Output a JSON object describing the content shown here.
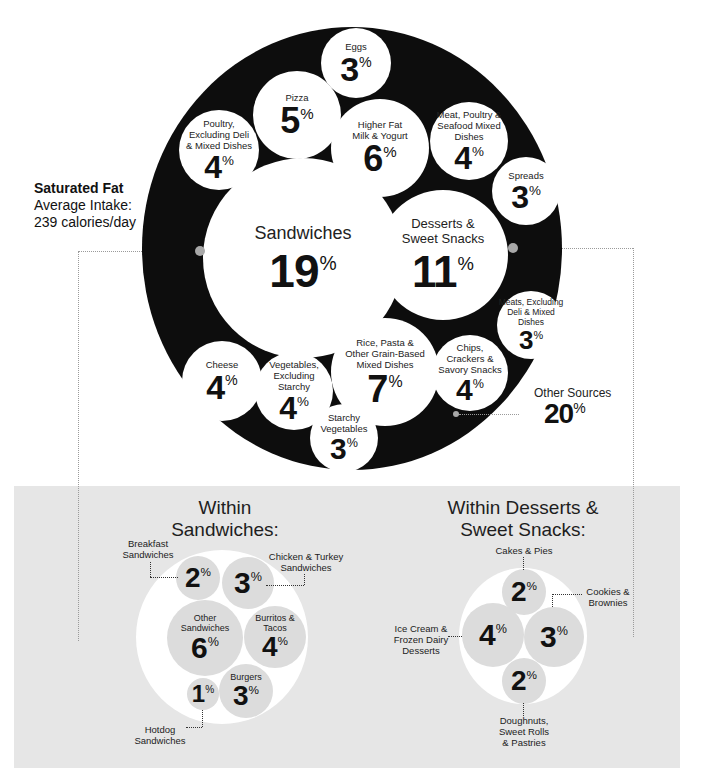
{
  "title": {
    "nutrient": "Saturated Fat",
    "subtitle_line1": "Average Intake:",
    "subtitle_line2": "239 calories/day"
  },
  "main_chart": {
    "ring_color": "#0d0d0d",
    "categories": [
      {
        "id": "eggs",
        "label": "Eggs",
        "value": "3",
        "unit": "%"
      },
      {
        "id": "pizza",
        "label": "Pizza",
        "value": "5",
        "unit": "%"
      },
      {
        "id": "poultry",
        "label": "Poultry, Excluding Deli & Mixed Dishes",
        "value": "4",
        "unit": "%"
      },
      {
        "id": "milk",
        "label": "Higher Fat Milk & Yogurt",
        "value": "6",
        "unit": "%"
      },
      {
        "id": "meat_mixed",
        "label": "Meat, Poultry & Seafood Mixed Dishes",
        "value": "4",
        "unit": "%"
      },
      {
        "id": "spreads",
        "label": "Spreads",
        "value": "3",
        "unit": "%"
      },
      {
        "id": "sandwiches",
        "label": "Sandwiches",
        "value": "19",
        "unit": "%"
      },
      {
        "id": "desserts",
        "label": "Desserts & Sweet Snacks",
        "value": "11",
        "unit": "%"
      },
      {
        "id": "meats",
        "label": "Meats, Excluding Deli & Mixed Dishes",
        "value": "3",
        "unit": "%"
      },
      {
        "id": "cheese",
        "label": "Cheese",
        "value": "4",
        "unit": "%"
      },
      {
        "id": "veg",
        "label": "Vegetables, Excluding Starchy",
        "value": "4",
        "unit": "%"
      },
      {
        "id": "rice",
        "label": "Rice, Pasta & Other Grain-Based Mixed Dishes",
        "value": "7",
        "unit": "%"
      },
      {
        "id": "chips",
        "label": "Chips, Crackers & Savory Snacks",
        "value": "4",
        "unit": "%"
      },
      {
        "id": "starchy",
        "label": "Starchy Vegetables",
        "value": "3",
        "unit": "%"
      }
    ],
    "other": {
      "label": "Other Sources",
      "value": "20",
      "unit": "%"
    }
  },
  "sandwich_panel": {
    "heading_line1": "Within",
    "heading_line2": "Sandwiches:",
    "items": [
      {
        "id": "breakfast",
        "label_line1": "Breakfast",
        "label_line2": "Sandwiches",
        "value": "2",
        "unit": "%"
      },
      {
        "id": "chicken",
        "label_line1": "Chicken & Turkey",
        "label_line2": "Sandwiches",
        "value": "3",
        "unit": "%"
      },
      {
        "id": "other",
        "label_line1": "Other",
        "label_line2": "Sandwiches",
        "value": "6",
        "unit": "%"
      },
      {
        "id": "burritos",
        "label_line1": "Burritos &",
        "label_line2": "Tacos",
        "value": "4",
        "unit": "%"
      },
      {
        "id": "hotdog",
        "label_line1": "Hotdog",
        "label_line2": "Sandwiches",
        "value": "1",
        "unit": "%"
      },
      {
        "id": "burgers",
        "label_line1": "Burgers",
        "label_line2": "",
        "value": "3",
        "unit": "%"
      }
    ]
  },
  "dessert_panel": {
    "heading_line1": "Within Desserts &",
    "heading_line2": "Sweet Snacks:",
    "items": [
      {
        "id": "cakes",
        "label_line1": "Cakes & Pies",
        "label_line2": "",
        "label_line3": "",
        "value": "2",
        "unit": "%"
      },
      {
        "id": "cookies",
        "label_line1": "Cookies &",
        "label_line2": "Brownies",
        "label_line3": "",
        "value": "3",
        "unit": "%"
      },
      {
        "id": "icecream",
        "label_line1": "Ice Cream &",
        "label_line2": "Frozen Dairy",
        "label_line3": "Desserts",
        "value": "4",
        "unit": "%"
      },
      {
        "id": "doughnuts",
        "label_line1": "Doughnuts,",
        "label_line2": "Sweet Rolls",
        "label_line3": "& Pastries",
        "value": "2",
        "unit": "%"
      }
    ]
  },
  "colors": {
    "ring": "#0d0d0d",
    "bubble": "#ffffff",
    "panel_bg": "#e6e6e6",
    "sub_bubble": "#dcdcdc",
    "connector_dot": "#a8a8a8"
  }
}
